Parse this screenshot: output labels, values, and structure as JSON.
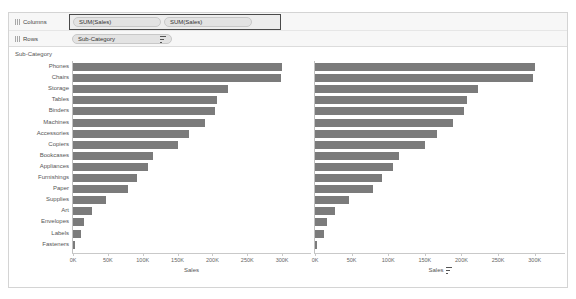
{
  "shelves": {
    "columns": {
      "label": "Columns",
      "grip_icon": "grip-icon",
      "pills": [
        {
          "label": "SUM(Sales)"
        },
        {
          "label": "SUM(Sales)"
        }
      ]
    },
    "rows": {
      "label": "Rows",
      "grip_icon": "grip-icon",
      "pills": [
        {
          "label": "Sub-Category",
          "sort_icon": "sort-descending-icon"
        }
      ]
    }
  },
  "view": {
    "row_header_title": "Sub-Category"
  },
  "chart_data": {
    "type": "bar",
    "title": "",
    "xlabel": "Sales",
    "ylabel": "Sub-Category",
    "orientation": "horizontal",
    "grid": false,
    "legend": "none",
    "xlim": [
      0,
      340000
    ],
    "xticks": [
      0,
      50000,
      100000,
      150000,
      200000,
      250000,
      300000
    ],
    "xtick_labels": [
      "0K",
      "50K",
      "100K",
      "150K",
      "200K",
      "250K",
      "300K"
    ],
    "categories": [
      "Phones",
      "Chairs",
      "Storage",
      "Tables",
      "Binders",
      "Machines",
      "Accessories",
      "Copiers",
      "Bookcases",
      "Appliances",
      "Furnishings",
      "Paper",
      "Supplies",
      "Art",
      "Envelopes",
      "Labels",
      "Fasteners"
    ],
    "panes": [
      {
        "name": "SUM(Sales)",
        "axis_title": "Sales",
        "sorted": false,
        "values": [
          300000,
          298000,
          223000,
          207000,
          203000,
          189000,
          167000,
          150000,
          115000,
          107000,
          92000,
          79000,
          47000,
          27000,
          16000,
          12000,
          3000
        ]
      },
      {
        "name": "SUM(Sales)",
        "axis_title": "Sales",
        "sorted": true,
        "sort_icon": "sort-descending-icon",
        "values": [
          300000,
          298000,
          223000,
          207000,
          203000,
          189000,
          167000,
          150000,
          115000,
          107000,
          92000,
          79000,
          47000,
          27000,
          16000,
          12000,
          3000
        ]
      }
    ]
  },
  "colors": {
    "bar": "#7b7b7b",
    "shelf_bg": "#f7f7f7",
    "pill_bg": "#e3e3e3",
    "selection_border": "#4a4a4a"
  }
}
